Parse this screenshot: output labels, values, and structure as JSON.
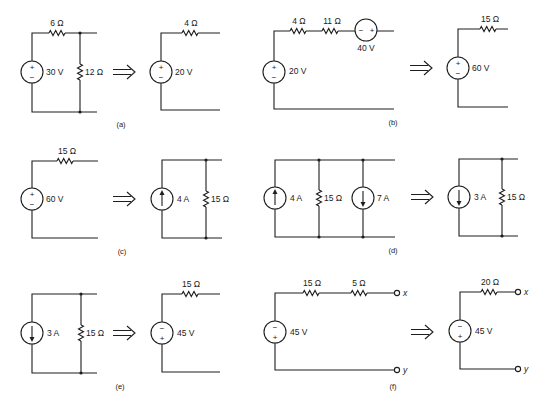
{
  "figure": {
    "panels": [
      {
        "id": "a",
        "caption": "(a)",
        "original": {
          "source": {
            "kind": "voltage",
            "value": "30 V",
            "top_sign": "+",
            "bottom_sign": "−"
          },
          "series_resistor": "6 Ω",
          "shunt_resistor": "12 Ω"
        },
        "equivalent": {
          "source": {
            "kind": "voltage",
            "value": "20 V",
            "top_sign": "+",
            "bottom_sign": "−"
          },
          "series_resistor": "4 Ω"
        }
      },
      {
        "id": "b",
        "caption": "(b)",
        "original": {
          "source": {
            "kind": "voltage",
            "value": "20 V",
            "top_sign": "+",
            "bottom_sign": "−"
          },
          "series_resistor_1": "4 Ω",
          "series_resistor_2": "11 Ω",
          "series_source": {
            "kind": "voltage",
            "value": "40 V",
            "left_sign": "−",
            "right_sign": "+"
          }
        },
        "equivalent": {
          "source": {
            "kind": "voltage",
            "value": "60 V",
            "top_sign": "+",
            "bottom_sign": "−"
          },
          "series_resistor": "15 Ω"
        }
      },
      {
        "id": "c",
        "caption": "(c)",
        "original": {
          "source": {
            "kind": "voltage",
            "value": "60 V",
            "top_sign": "+",
            "bottom_sign": "−"
          },
          "series_resistor": "15 Ω"
        },
        "equivalent": {
          "source": {
            "kind": "current",
            "value": "4 A",
            "direction": "up"
          },
          "shunt_resistor": "15 Ω"
        }
      },
      {
        "id": "d",
        "caption": "(d)",
        "original": {
          "source_1": {
            "kind": "current",
            "value": "4 A",
            "direction": "up"
          },
          "shunt_resistor": "15 Ω",
          "source_2": {
            "kind": "current",
            "value": "7 A",
            "direction": "down"
          }
        },
        "equivalent": {
          "source": {
            "kind": "current",
            "value": "3 A",
            "direction": "down"
          },
          "shunt_resistor": "15 Ω"
        }
      },
      {
        "id": "e",
        "caption": "(e)",
        "original": {
          "source": {
            "kind": "current",
            "value": "3 A",
            "direction": "down"
          },
          "shunt_resistor": "15 Ω"
        },
        "equivalent": {
          "source": {
            "kind": "voltage",
            "value": "45 V",
            "top_sign": "−",
            "bottom_sign": "+"
          },
          "series_resistor": "15 Ω"
        }
      },
      {
        "id": "f",
        "caption": "(f)",
        "original": {
          "source": {
            "kind": "voltage",
            "value": "45 V",
            "top_sign": "−",
            "bottom_sign": "+"
          },
          "series_resistor_1": "15 Ω",
          "series_resistor_2": "5 Ω",
          "terminal_top": "x",
          "terminal_bottom": "y"
        },
        "equivalent": {
          "source": {
            "kind": "voltage",
            "value": "45 V",
            "top_sign": "−",
            "bottom_sign": "+"
          },
          "series_resistor": "20 Ω",
          "terminal_top": "x",
          "terminal_bottom": "y"
        }
      }
    ],
    "transform_arrow": "double-right-arrow"
  }
}
